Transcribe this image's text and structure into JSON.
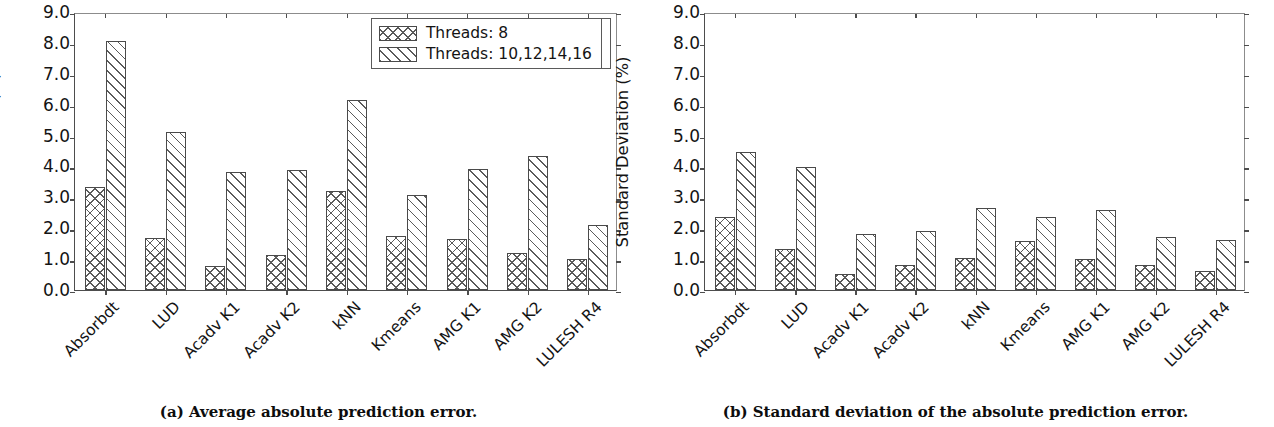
{
  "figure": {
    "panels": [
      {
        "id": "panel-a",
        "caption": "(a) Average absolute prediction error."
      },
      {
        "id": "panel-b",
        "caption": "(b) Standard deviation of the absolute prediction error."
      }
    ]
  },
  "legend": {
    "position": "upper right",
    "entries": [
      {
        "label": "Threads: 8",
        "pattern": "cross"
      },
      {
        "label": "Threads: 10,12,14,16",
        "pattern": "diag"
      }
    ]
  },
  "axis": {
    "yticks": [
      "0.0",
      "1.0",
      "2.0",
      "3.0",
      "4.0",
      "5.0",
      "6.0",
      "7.0",
      "8.0",
      "9.0"
    ]
  },
  "chart_data": [
    {
      "type": "bar",
      "title": "",
      "xlabel": "",
      "ylabel": "Prediction Error (%)",
      "ylim": [
        0,
        9
      ],
      "ytick_step": 1.0,
      "grid": false,
      "legend_position": "upper right",
      "categories": [
        "Absorbdt",
        "LUD",
        "Acadv K1",
        "Acadv K2",
        "kNN",
        "Kmeans",
        "AMG K1",
        "AMG K2",
        "LULESH R4"
      ],
      "series": [
        {
          "name": "Threads: 8",
          "pattern": "cross",
          "values": [
            3.35,
            1.7,
            0.78,
            1.12,
            3.2,
            1.75,
            1.65,
            1.2,
            1.02
          ]
        },
        {
          "name": "Threads: 10,12,14,16",
          "pattern": "diag",
          "values": [
            8.05,
            5.1,
            3.82,
            3.88,
            6.15,
            3.08,
            3.93,
            4.35,
            2.1
          ]
        }
      ]
    },
    {
      "type": "bar",
      "title": "",
      "xlabel": "",
      "ylabel": "Standard Deviation (%)",
      "ylim": [
        0,
        9
      ],
      "ytick_step": 1.0,
      "grid": false,
      "legend_position": "upper right",
      "categories": [
        "Absorbdt",
        "LUD",
        "Acadv K1",
        "Acadv K2",
        "kNN",
        "Kmeans",
        "AMG K1",
        "AMG K2",
        "LULESH R4"
      ],
      "series": [
        {
          "name": "Threads: 8",
          "pattern": "cross",
          "values": [
            2.38,
            1.33,
            0.52,
            0.8,
            1.03,
            1.6,
            1.0,
            0.8,
            0.62
          ]
        },
        {
          "name": "Threads: 10,12,14,16",
          "pattern": "diag",
          "values": [
            4.48,
            3.98,
            1.8,
            1.92,
            2.65,
            2.35,
            2.6,
            1.73,
            1.62
          ]
        }
      ]
    }
  ]
}
